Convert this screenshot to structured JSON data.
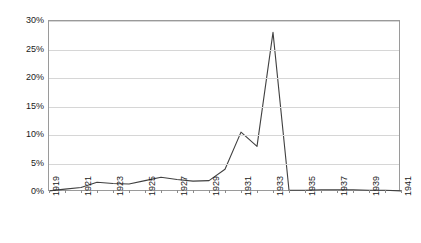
{
  "chart_data": {
    "type": "line",
    "title": "",
    "subtitle": "",
    "xlabel": "",
    "ylabel": "",
    "grid": true,
    "legend": false,
    "xlim": [
      1919,
      1941
    ],
    "ylim": [
      0,
      30
    ],
    "y_tick_labels": [
      "0%",
      "5%",
      "10%",
      "15%",
      "20%",
      "25%",
      "30%"
    ],
    "y_ticks": [
      0,
      5,
      10,
      15,
      20,
      25,
      30
    ],
    "x_tick_labels": [
      "1919",
      "1921",
      "1923",
      "1925",
      "1927",
      "1929",
      "1931",
      "1933",
      "1935",
      "1937",
      "1939",
      "1941"
    ],
    "x_ticks": [
      1919,
      1921,
      1923,
      1925,
      1927,
      1929,
      1931,
      1933,
      1935,
      1937,
      1939,
      1941
    ],
    "x": [
      1919,
      1920,
      1921,
      1922,
      1923,
      1924,
      1925,
      1926,
      1927,
      1928,
      1929,
      1930,
      1931,
      1932,
      1933,
      1934,
      1935,
      1936,
      1937,
      1938,
      1939,
      1940,
      1941
    ],
    "values": [
      0.2,
      0.5,
      0.8,
      1.7,
      1.5,
      1.4,
      2.0,
      2.6,
      2.2,
      1.9,
      2.0,
      4.0,
      10.5,
      8.0,
      28.0,
      0.3,
      0.3,
      0.4,
      0.4,
      0.4,
      0.3,
      0.3,
      0.2
    ],
    "series": [
      {
        "name": "series-1",
        "color": "#404040",
        "values": [
          0.2,
          0.5,
          0.8,
          1.7,
          1.5,
          1.4,
          2.0,
          2.6,
          2.2,
          1.9,
          2.0,
          4.0,
          10.5,
          8.0,
          28.0,
          0.3,
          0.3,
          0.4,
          0.4,
          0.4,
          0.3,
          0.3,
          0.2
        ]
      }
    ],
    "colors": {
      "line": "#404040",
      "grid": "#d6d6d6",
      "frame": "#9a9a9a",
      "text": "#1a1a1a",
      "background": "#ffffff"
    }
  }
}
